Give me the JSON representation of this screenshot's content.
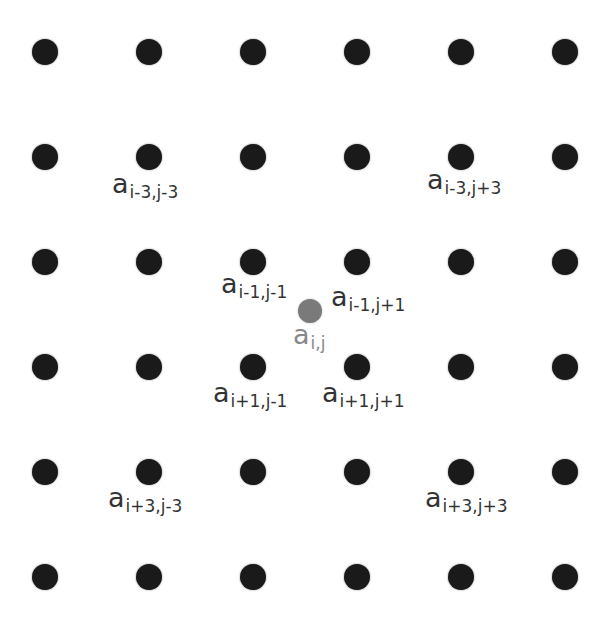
{
  "diagram": {
    "title": "",
    "grid": {
      "rows": 6,
      "cols": 6,
      "col_x": [
        45,
        149,
        253,
        357,
        461,
        565
      ],
      "row_y": [
        52,
        157,
        262,
        367,
        472,
        577
      ],
      "dot_color": "#1a1a1a"
    },
    "center_point": {
      "x": 310,
      "y": 311,
      "color": "#7a7a7a"
    },
    "labels": [
      {
        "id": "a_im3_jm3",
        "base": "a",
        "sub": "i-3,j-3",
        "x": 112,
        "y": 170
      },
      {
        "id": "a_im3_jp3",
        "base": "a",
        "sub": "i-3,j+3",
        "x": 427,
        "y": 166
      },
      {
        "id": "a_im1_jm1",
        "base": "a",
        "sub": "i-1,j-1",
        "x": 221,
        "y": 270
      },
      {
        "id": "a_im1_jp1",
        "base": "a",
        "sub": "i-1,j+1",
        "x": 331,
        "y": 283
      },
      {
        "id": "a_i_j",
        "base": "a",
        "sub": "i,j",
        "x": 293,
        "y": 321,
        "center": true
      },
      {
        "id": "a_ip1_jm1",
        "base": "a",
        "sub": "i+1,j-1",
        "x": 213,
        "y": 379
      },
      {
        "id": "a_ip1_jp1",
        "base": "a",
        "sub": "i+1,j+1",
        "x": 322,
        "y": 379
      },
      {
        "id": "a_ip3_jm3",
        "base": "a",
        "sub": "i+3,j-3",
        "x": 108,
        "y": 484
      },
      {
        "id": "a_ip3_jp3",
        "base": "a",
        "sub": "i+3,j+3",
        "x": 425,
        "y": 484
      }
    ]
  }
}
